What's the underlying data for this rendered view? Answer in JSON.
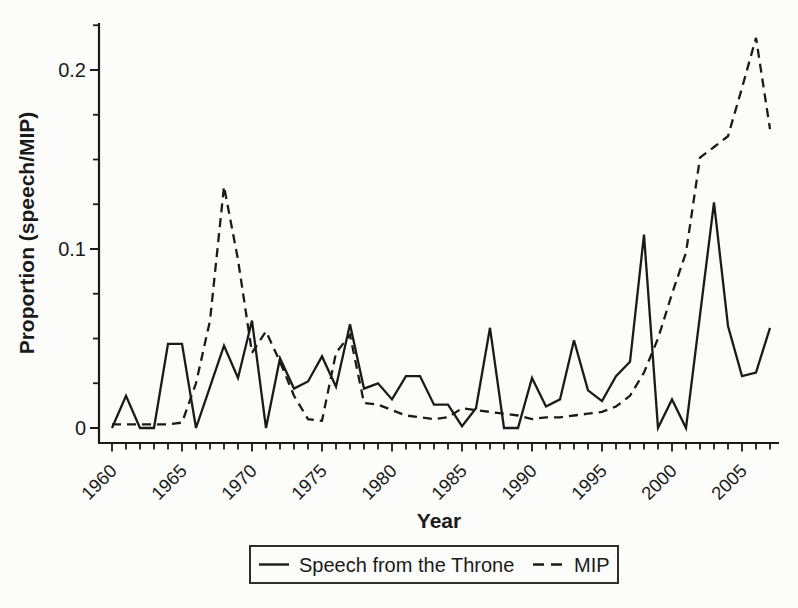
{
  "figure": {
    "background_color": "#fcfcfb",
    "line_color": "#1a1a1a",
    "legend_border_color": "#2e2e2e"
  },
  "chart_data": {
    "type": "line",
    "title": "",
    "xlabel": "Year",
    "ylabel": "Proportion (speech/MIP)",
    "x": [
      1960,
      1961,
      1962,
      1963,
      1964,
      1965,
      1966,
      1967,
      1968,
      1969,
      1970,
      1971,
      1972,
      1973,
      1974,
      1975,
      1976,
      1977,
      1978,
      1979,
      1980,
      1981,
      1982,
      1983,
      1984,
      1985,
      1986,
      1987,
      1988,
      1989,
      1990,
      1991,
      1992,
      1993,
      1994,
      1995,
      1996,
      1997,
      1998,
      1999,
      2000,
      2001,
      2002,
      2003,
      2004,
      2005,
      2006,
      2007
    ],
    "series": [
      {
        "name": "Speech from the Throne",
        "style": "solid",
        "values": [
          0,
          0.018,
          0,
          0,
          0.047,
          0.047,
          0,
          0.023,
          0.046,
          0.028,
          0.06,
          0,
          0.039,
          0.022,
          0.026,
          0.04,
          0.023,
          0.058,
          0.022,
          0.025,
          0.016,
          0.029,
          0.029,
          0.013,
          0.013,
          0.001,
          0.011,
          0.056,
          0,
          0,
          0.028,
          0.012,
          0.016,
          0.049,
          0.021,
          0.015,
          0.029,
          0.037,
          0.108,
          0,
          0.016,
          0,
          0.063,
          0.126,
          0.057,
          0.029,
          0.031,
          0.056
        ]
      },
      {
        "name": "MIP",
        "style": "dashed",
        "values": [
          0.002,
          0.002,
          0.002,
          0.002,
          0.002,
          0.003,
          0.025,
          0.06,
          0.135,
          0.094,
          0.042,
          0.054,
          0.037,
          0.018,
          0.005,
          0.004,
          0.042,
          0.052,
          0.014,
          0.013,
          0.01,
          0.007,
          0.006,
          0.005,
          0.006,
          0.011,
          0.01,
          0.009,
          0.008,
          0.007,
          0.005,
          0.006,
          0.006,
          0.007,
          0.008,
          0.009,
          0.012,
          0.018,
          0.031,
          0.05,
          0.075,
          0.098,
          0.151,
          0.157,
          0.163,
          0.19,
          0.218,
          0.167
        ]
      }
    ],
    "xlim": [
      1959,
      2008
    ],
    "ylim": [
      0,
      0.235
    ],
    "grid": false,
    "legend_position": "bottom-center",
    "yticks": {
      "major": [
        0,
        0.1,
        0.2
      ],
      "labels": [
        "0",
        "0.1",
        "0.2"
      ],
      "minor_step": 0.025,
      "minor_max": 0.225
    },
    "xticks": {
      "major": [
        1960,
        1965,
        1970,
        1975,
        1980,
        1985,
        1990,
        1995,
        2000,
        2005
      ],
      "labels": [
        "1960",
        "1965",
        "1970",
        "1975",
        "1980",
        "1985",
        "1990",
        "1995",
        "2000",
        "2005"
      ],
      "minor_step": 1,
      "minor_start": 1960,
      "minor_end": 2007,
      "label_angle_deg": 45
    }
  }
}
